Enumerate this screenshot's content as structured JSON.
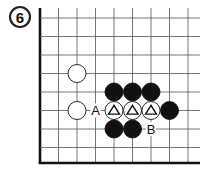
{
  "problem": {
    "number": "6"
  },
  "board": {
    "x_lines": [
      40,
      58.5,
      77,
      95.5,
      114,
      132.5,
      151,
      169.5,
      188
    ],
    "y_lines": [
      18,
      36.5,
      55,
      73.5,
      92,
      110.5,
      129,
      147.5
    ],
    "left_edge_x": 40,
    "bottom_edge_y": 163,
    "line_color": "#555555",
    "edge_color": "#111111"
  },
  "stones": [
    {
      "color": "white",
      "col": 2,
      "row": 3,
      "mark": ""
    },
    {
      "color": "white",
      "col": 2,
      "row": 5,
      "mark": ""
    },
    {
      "color": "black",
      "col": 4,
      "row": 4,
      "mark": ""
    },
    {
      "color": "black",
      "col": 5,
      "row": 4,
      "mark": ""
    },
    {
      "color": "black",
      "col": 6,
      "row": 4,
      "mark": ""
    },
    {
      "color": "white",
      "col": 4,
      "row": 5,
      "mark": "triangle"
    },
    {
      "color": "white",
      "col": 5,
      "row": 5,
      "mark": "triangle"
    },
    {
      "color": "white",
      "col": 6,
      "row": 5,
      "mark": "triangle"
    },
    {
      "color": "black",
      "col": 7,
      "row": 5,
      "mark": ""
    },
    {
      "color": "black",
      "col": 4,
      "row": 6,
      "mark": ""
    },
    {
      "color": "black",
      "col": 5,
      "row": 6,
      "mark": ""
    }
  ],
  "labels": [
    {
      "text": "A",
      "col": 3,
      "row": 5
    },
    {
      "text": "B",
      "col": 6,
      "row": 6
    }
  ]
}
